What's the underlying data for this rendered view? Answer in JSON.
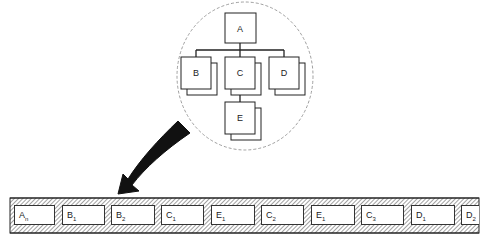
{
  "tree": {
    "root": "A",
    "children": [
      "B",
      "C",
      "D"
    ],
    "grandchild": {
      "parent": "C",
      "label": "E"
    }
  },
  "strip": {
    "cells": [
      {
        "base": "A",
        "sub": "n"
      },
      {
        "base": "B",
        "sub": "1"
      },
      {
        "base": "B",
        "sub": "2"
      },
      {
        "base": "C",
        "sub": "1"
      },
      {
        "base": "E",
        "sub": "1"
      },
      {
        "base": "C",
        "sub": "2"
      },
      {
        "base": "E",
        "sub": "1"
      },
      {
        "base": "C",
        "sub": "3"
      },
      {
        "base": "D",
        "sub": "1"
      },
      {
        "base": "D",
        "sub": "2"
      }
    ]
  },
  "colors": {
    "line": "#222222",
    "circle": "#888888",
    "hatch": "#444444"
  }
}
